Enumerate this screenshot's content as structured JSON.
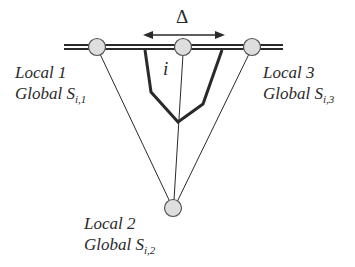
{
  "diagram": {
    "delta_symbol": "Δ",
    "index_label": "i",
    "nodes": [
      {
        "id": "local-1",
        "local": "Local 1",
        "global_prefix": "Global S",
        "global_sub": "i,1"
      },
      {
        "id": "local-2",
        "local": "Local 2",
        "global_prefix": "Global S",
        "global_sub": "i,2"
      },
      {
        "id": "local-3",
        "local": "Local 3",
        "global_prefix": "Global S",
        "global_sub": "i,3"
      }
    ],
    "colors": {
      "line": "#2a2a2a",
      "node_fill": "#dedede",
      "node_stroke": "#555555"
    }
  }
}
